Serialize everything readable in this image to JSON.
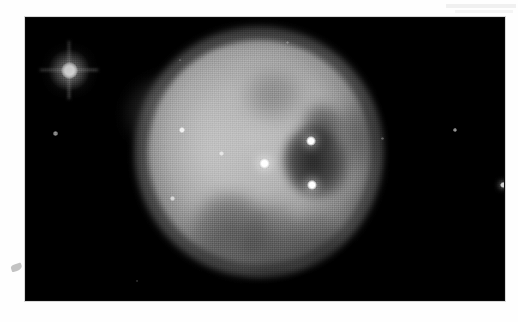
{
  "page": {
    "background_color": "#ffffff",
    "width": 518,
    "height": 322,
    "caption": "",
    "artifacts": [
      {
        "name": "scanner-streak",
        "x": 446,
        "y": 4,
        "width": 70,
        "height": 4,
        "color": "#f0f0f0"
      },
      {
        "name": "scanner-streak-2",
        "x": 455,
        "y": 10,
        "width": 58,
        "height": 3,
        "color": "#f4f4f4"
      },
      {
        "name": "edge-smudge",
        "x": 11,
        "y": 264,
        "width": 11,
        "height": 7,
        "color": "#b9b9b9"
      }
    ]
  },
  "plate": {
    "name": "astronomical-photographic-plate",
    "x": 26,
    "y": 18,
    "width": 478,
    "height": 282,
    "background_color": "#000000",
    "medium": "halftone-printed-grayscale-photograph",
    "subject": "planetary nebula",
    "alt_text": "Grayscale astronomical photograph of a large round planetary nebula with a mottled interior, a dark cavity north-east of centre, several embedded point stars and a bright foreground star with diffraction spikes at upper left."
  },
  "nebula": {
    "name": "planetary-nebula",
    "shape": "circular disc",
    "center_x": 265,
    "center_y": 165,
    "radius": 108,
    "peak_gray": "#c4c4c4",
    "halo_gray": "#8f8f8f",
    "features": [
      {
        "name": "dark-cavity",
        "center_x": 296,
        "center_y": 152,
        "width": 64,
        "height": 72,
        "relative_brightness": "dark"
      },
      {
        "name": "cavity-extension",
        "center_x": 304,
        "center_y": 118,
        "width": 40,
        "height": 46,
        "relative_brightness": "dark"
      },
      {
        "name": "northwest-wisp",
        "center_x": 156,
        "center_y": 114,
        "width": 70,
        "height": 72,
        "relative_brightness": "faint"
      },
      {
        "name": "southern-mottling-left",
        "center_x": 230,
        "center_y": 230,
        "width": 76,
        "height": 72,
        "relative_brightness": "dark"
      },
      {
        "name": "southern-mottling-mid",
        "center_x": 272,
        "center_y": 243,
        "width": 64,
        "height": 78,
        "relative_brightness": "dark"
      },
      {
        "name": "southern-mottling-right",
        "center_x": 316,
        "center_y": 244,
        "width": 52,
        "height": 64,
        "relative_brightness": "dark"
      },
      {
        "name": "northern-mottling",
        "center_x": 273,
        "center_y": 95,
        "width": 58,
        "height": 50,
        "relative_brightness": "dark"
      },
      {
        "name": "east-rim-shadow",
        "center_x": 361,
        "center_y": 137,
        "width": 46,
        "height": 66,
        "relative_brightness": "dark"
      },
      {
        "name": "bright-west-rim",
        "center_x": 200,
        "center_y": 152,
        "width": 96,
        "height": 176,
        "relative_brightness": "bright"
      },
      {
        "name": "bright-north-rim",
        "center_x": 277,
        "center_y": 86,
        "width": 150,
        "height": 80,
        "relative_brightness": "bright"
      }
    ]
  },
  "stars": [
    {
      "name": "bright-foreground-star",
      "x": 69,
      "y": 70,
      "size": 17,
      "brightness": "very bright",
      "has_diffraction_spikes": true
    },
    {
      "name": "central-star",
      "x": 264,
      "y": 163,
      "size": 11,
      "brightness": "bright",
      "has_diffraction_spikes": false
    },
    {
      "name": "star-northeast",
      "x": 311,
      "y": 141,
      "size": 10,
      "brightness": "bright",
      "has_diffraction_spikes": false
    },
    {
      "name": "star-southeast",
      "x": 312,
      "y": 185,
      "size": 10,
      "brightness": "bright",
      "has_diffraction_spikes": false
    },
    {
      "name": "star-northwest-inner",
      "x": 182,
      "y": 130,
      "size": 6,
      "brightness": "moderate",
      "has_diffraction_spikes": false
    },
    {
      "name": "star-west-inner",
      "x": 221,
      "y": 153,
      "size": 5,
      "brightness": "faint",
      "has_diffraction_spikes": false
    },
    {
      "name": "star-southwest-inner",
      "x": 172,
      "y": 198,
      "size": 5,
      "brightness": "faint",
      "has_diffraction_spikes": false
    },
    {
      "name": "star-field-west",
      "x": 55,
      "y": 133,
      "size": 5,
      "brightness": "faint",
      "has_diffraction_spikes": false
    },
    {
      "name": "star-field-east",
      "x": 455,
      "y": 130,
      "size": 4,
      "brightness": "faint",
      "has_diffraction_spikes": false
    },
    {
      "name": "star-field-east-inner",
      "x": 382,
      "y": 138,
      "size": 3,
      "brightness": "very faint",
      "has_diffraction_spikes": false
    },
    {
      "name": "star-field-north",
      "x": 287,
      "y": 42,
      "size": 3,
      "brightness": "very faint",
      "has_diffraction_spikes": false
    },
    {
      "name": "star-field-northeast",
      "x": 180,
      "y": 60,
      "size": 2,
      "brightness": "very faint",
      "has_diffraction_spikes": false
    },
    {
      "name": "star-field-southwest",
      "x": 137,
      "y": 281,
      "size": 2,
      "brightness": "very faint",
      "has_diffraction_spikes": false
    },
    {
      "name": "plate-edge-blemish",
      "x": 503,
      "y": 185,
      "size": 6,
      "brightness": "bright",
      "has_diffraction_spikes": false
    }
  ]
}
